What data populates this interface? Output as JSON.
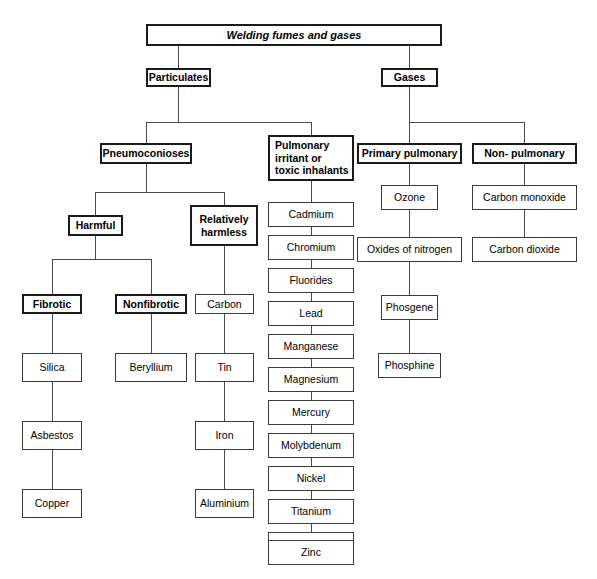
{
  "diagram": {
    "title": "Welding fumes and gases",
    "root": {
      "label": "Welding fumes and gases"
    },
    "level1": {
      "particulates": "Particulates",
      "gases": "Gases"
    },
    "level2": {
      "pneumoconioses": "Pneumoconioses",
      "pulmonary_irritant": "Pulmonary\nirritant or\ntoxic inhalants",
      "primary_pulmonary": "Primary pulmonary",
      "non_pulmonary": "Non- pulmonary"
    },
    "level3": {
      "harmful": "Harmful",
      "relatively_harmless": "Relatively\nharmless"
    },
    "level4": {
      "fibrotic": "Fibrotic",
      "nonfibrotic": "Nonfibrotic",
      "carbon": "Carbon"
    },
    "fibrotic_chain": [
      "Silica",
      "Asbestos",
      "Copper"
    ],
    "nonfibrotic_chain": [
      "Beryllium"
    ],
    "carbon_chain": [
      "Tin",
      "Iron",
      "Aluminium"
    ],
    "irritant_chain": [
      "Cadmium",
      "Chromium",
      "Fluorides",
      "Lead",
      "Manganese",
      "Magnesium",
      "Mercury",
      "Molybdenum",
      "Nickel",
      "Titanium",
      "Vanadium",
      "Zinc"
    ],
    "primary_pulmonary_chain": [
      "Ozone",
      "Oxides of nitrogen",
      "Phosgene",
      "Phosphine"
    ],
    "non_pulmonary_chain": [
      "Carbon monoxide",
      "Carbon dioxide"
    ],
    "colors": {
      "background": "#ffffff",
      "box_fill": "#ffffff",
      "box_border": "#3a3a3a",
      "emphasis_border": "#1a1a1a",
      "connector": "#4a4a4a",
      "text": "#000000"
    }
  }
}
